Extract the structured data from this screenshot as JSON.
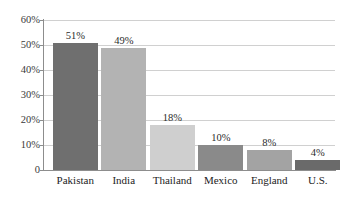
{
  "chart_data": {
    "type": "bar",
    "title": "",
    "xlabel": "",
    "ylabel": "",
    "categories": [
      "Pakistan",
      "India",
      "Thailand",
      "Mexico",
      "England",
      "U.S."
    ],
    "values": [
      51,
      49,
      18,
      10,
      8,
      4
    ],
    "value_labels": [
      "51%",
      "49%",
      "18%",
      "10%",
      "8%",
      "4%"
    ],
    "bar_colors": [
      "#6f6f6f",
      "#b3b3b3",
      "#cfcfcf",
      "#8a8a8a",
      "#a3a3a3",
      "#6a6a6a"
    ],
    "ylim": [
      0,
      60
    ],
    "yticks": [
      0,
      10,
      20,
      30,
      40,
      50,
      60
    ],
    "ytick_labels": [
      "0",
      "10%",
      "20%",
      "30%",
      "40%",
      "50%",
      "60%"
    ],
    "grid": true,
    "legend": "none",
    "gridline_color": "#d0d0d0",
    "axis_color": "#8d8d8d",
    "background_color": "#ffffff"
  }
}
